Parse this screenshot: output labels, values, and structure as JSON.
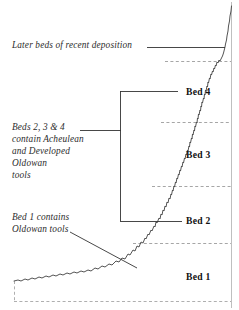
{
  "figure": {
    "type": "stratigraphic-profile-diagram",
    "annotations": {
      "later_beds": "Later beds of recent deposition",
      "beds_234": "Beds 2, 3 & 4\ncontain Acheulean\nand Developed\nOldowan\ntools",
      "bed_1_note": "Bed 1 contains\nOldowan tools"
    },
    "bed_labels": [
      {
        "id": "bed-4",
        "text": "Bed 4"
      },
      {
        "id": "bed-3",
        "text": "Bed 3"
      },
      {
        "id": "bed-2",
        "text": "Bed 2"
      },
      {
        "id": "bed-1",
        "text": "Bed 1"
      }
    ],
    "colors": {
      "profile_line": "#4a4a4a",
      "leader_line": "#333333",
      "dashed_boundary": "#8f8f8f",
      "frame_line": "#b5b5b5",
      "annotation_text": "#2b2b2b",
      "bed_label_text": "#111111",
      "background": "#ffffff"
    },
    "boundaries": [
      {
        "id": "boundary-top-recent",
        "y": 61,
        "style": "dashed"
      },
      {
        "id": "boundary-bed4-bed3",
        "y": 122,
        "style": "dashed"
      },
      {
        "id": "boundary-bed3-bed2",
        "y": 186,
        "style": "dashed"
      },
      {
        "id": "boundary-bed2-bed1",
        "y": 243,
        "style": "dashed"
      },
      {
        "id": "boundary-base",
        "y": 301,
        "style": "dashed"
      }
    ]
  }
}
